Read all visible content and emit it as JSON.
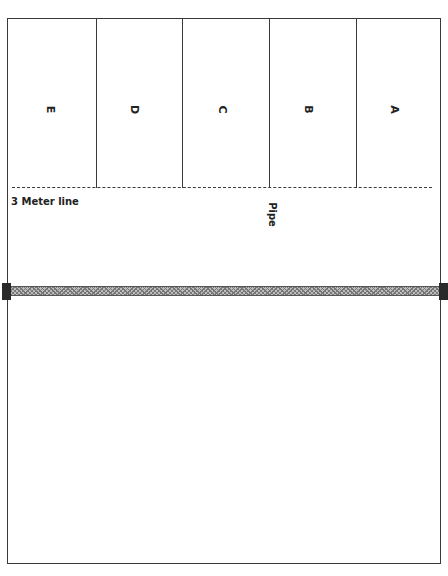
{
  "diagram": {
    "type": "volleyball-court-zones",
    "zones": [
      {
        "label": "E",
        "rotated": true
      },
      {
        "label": "D",
        "rotated": true
      },
      {
        "label": "C",
        "rotated": true
      },
      {
        "label": "B",
        "rotated": true
      },
      {
        "label": "A",
        "rotated": true
      }
    ],
    "attack_line_label": "3 Meter line",
    "pipe_label": "Pipe",
    "net": {
      "present": true
    },
    "colors": {
      "lines": "#3a3a3a",
      "net": "#bdbdbd",
      "posts": "#2a2a2a"
    }
  }
}
